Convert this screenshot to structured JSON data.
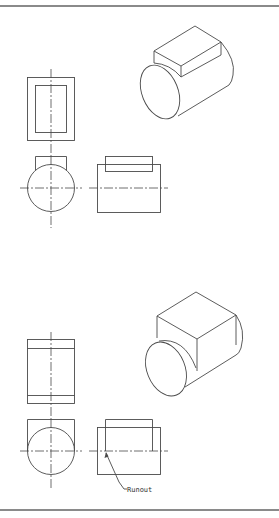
{
  "figure": {
    "line_color": "#4a4a4a",
    "rule_color": "#8a8a8a"
  },
  "examples": [
    {
      "id": "top",
      "views": [
        "top-view",
        "front-view",
        "side-view",
        "isometric-view"
      ],
      "block": "narrow key on cylinder"
    },
    {
      "id": "bottom",
      "views": [
        "top-view",
        "front-view",
        "side-view",
        "isometric-view"
      ],
      "block": "full-width block on cylinder",
      "annotation": {
        "label": "Runout"
      }
    }
  ]
}
